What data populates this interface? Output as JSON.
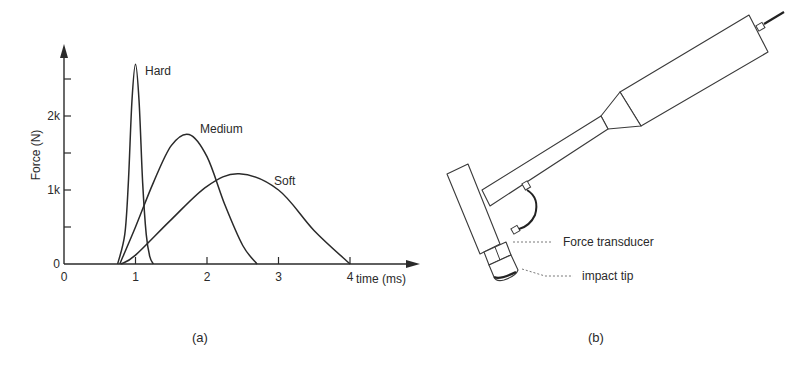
{
  "panels": {
    "a": {
      "caption": "(a)"
    },
    "b": {
      "caption": "(b)",
      "labels": {
        "force_transducer": "Force transducer",
        "impact_tip": "impact tip"
      }
    }
  },
  "chart_data": {
    "type": "line",
    "title": "",
    "xlabel": "time (ms)",
    "ylabel": "Force (N)",
    "xlim": [
      0,
      4.4
    ],
    "ylim": [
      0,
      2900
    ],
    "x_ticks": [
      0,
      1,
      2,
      3,
      4
    ],
    "x_tick_labels": [
      "0",
      "1",
      "2",
      "3",
      "4"
    ],
    "y_ticks": [
      0,
      500,
      1000,
      1500,
      2000,
      2500
    ],
    "y_tick_labels": [
      "0",
      "",
      "1k",
      "",
      "2k",
      ""
    ],
    "grid": false,
    "legend": "inline labels",
    "series": [
      {
        "name": "Hard",
        "label": "Hard",
        "x": [
          0.75,
          0.85,
          0.9,
          0.95,
          1.0,
          1.05,
          1.1,
          1.15,
          1.2,
          1.25
        ],
        "y": [
          0,
          400,
          1100,
          2200,
          2700,
          2200,
          1100,
          400,
          100,
          0
        ]
      },
      {
        "name": "Medium",
        "label": "Medium",
        "x": [
          0.78,
          1.0,
          1.25,
          1.5,
          1.75,
          2.0,
          2.25,
          2.5,
          2.7
        ],
        "y": [
          0,
          500,
          1100,
          1600,
          1750,
          1450,
          800,
          250,
          0
        ]
      },
      {
        "name": "Soft",
        "label": "Soft",
        "x": [
          0.8,
          1.0,
          1.5,
          2.0,
          2.45,
          3.0,
          3.5,
          4.0
        ],
        "y": [
          0,
          120,
          600,
          1050,
          1220,
          1000,
          450,
          0
        ]
      }
    ]
  }
}
